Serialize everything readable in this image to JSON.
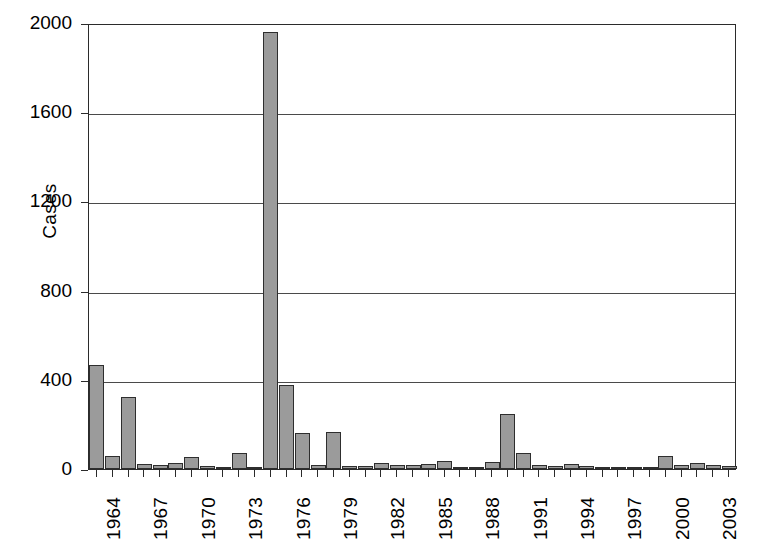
{
  "chart_data": {
    "type": "bar",
    "title": "",
    "xlabel": "",
    "ylabel": "Cases",
    "ylim": [
      0,
      2000
    ],
    "yticks": [
      0,
      400,
      800,
      1200,
      1600,
      2000
    ],
    "grid": true,
    "legend": null,
    "categories": [
      "1964",
      "1965",
      "1966",
      "1967",
      "1968",
      "1969",
      "1970",
      "1971",
      "1972",
      "1973",
      "1974",
      "1975",
      "1976",
      "1977",
      "1978",
      "1979",
      "1980",
      "1981",
      "1982",
      "1983",
      "1984",
      "1985",
      "1986",
      "1987",
      "1988",
      "1989",
      "1990",
      "1991",
      "1992",
      "1993",
      "1994",
      "1995",
      "1996",
      "1997",
      "1998",
      "1999",
      "2000",
      "2001",
      "2002",
      "2003",
      "2004"
    ],
    "values": [
      466,
      60,
      325,
      22,
      18,
      25,
      55,
      15,
      10,
      70,
      8,
      1960,
      375,
      160,
      20,
      165,
      15,
      12,
      25,
      20,
      18,
      22,
      35,
      10,
      8,
      30,
      245,
      70,
      18,
      15,
      22,
      12,
      10,
      8,
      6,
      5,
      60,
      20,
      25,
      18,
      12
    ],
    "xtick_labels": [
      "1964",
      "1967",
      "1970",
      "1973",
      "1976",
      "1979",
      "1982",
      "1985",
      "1988",
      "1991",
      "1994",
      "1997",
      "2000",
      "2003"
    ],
    "axis_color": "#2b2b2b",
    "bar_fill_color": "#9b9b9b",
    "bar_edge_color": "#2e2e2e",
    "gridline_color": "#4a4a4a",
    "background_color": "#ffffff"
  }
}
